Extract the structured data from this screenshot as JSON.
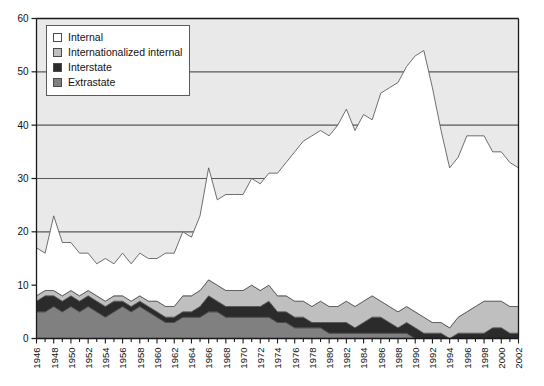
{
  "chart_data": {
    "type": "area",
    "stacked": true,
    "title": "",
    "subtitle": "",
    "xlabel": "",
    "ylabel": "",
    "xlim": [
      1946,
      2002
    ],
    "ylim": [
      0,
      60
    ],
    "yticks": [
      0,
      10,
      20,
      30,
      40,
      50,
      60
    ],
    "grid": "horizontal",
    "legend_position": "top-left",
    "x_tick_step_minor": 1,
    "x_tick_step_label": 2,
    "x": [
      1946,
      1947,
      1948,
      1949,
      1950,
      1951,
      1952,
      1953,
      1954,
      1955,
      1956,
      1957,
      1958,
      1959,
      1960,
      1961,
      1962,
      1963,
      1964,
      1965,
      1966,
      1967,
      1968,
      1969,
      1970,
      1971,
      1972,
      1973,
      1974,
      1975,
      1976,
      1977,
      1978,
      1979,
      1980,
      1981,
      1982,
      1983,
      1984,
      1985,
      1986,
      1987,
      1988,
      1989,
      1990,
      1991,
      1992,
      1993,
      1994,
      1995,
      1996,
      1997,
      1998,
      1999,
      2000,
      2001,
      2002
    ],
    "xtick_labels": [
      "1946",
      "1948",
      "1950",
      "1952",
      "1954",
      "1956",
      "1958",
      "1960",
      "1962",
      "1964",
      "1966",
      "1968",
      "1970",
      "1972",
      "1974",
      "1976",
      "1978",
      "1980",
      "1982",
      "1984",
      "1986",
      "1988",
      "1990",
      "1992",
      "1994",
      "1996",
      "1998",
      "2000",
      "2002"
    ],
    "series": [
      {
        "name": "Extrastate",
        "color": "#808080",
        "values": [
          5,
          5,
          6,
          5,
          6,
          5,
          6,
          5,
          4,
          5,
          6,
          5,
          6,
          5,
          4,
          3,
          3,
          4,
          4,
          4,
          5,
          5,
          4,
          4,
          4,
          4,
          4,
          4,
          3,
          3,
          2,
          2,
          2,
          2,
          1,
          1,
          1,
          1,
          1,
          1,
          1,
          1,
          1,
          1,
          0,
          0,
          0,
          0,
          0,
          0,
          0,
          0,
          0,
          0,
          0,
          0,
          0
        ]
      },
      {
        "name": "Interstate",
        "color": "#2b2b2b",
        "values": [
          2,
          3,
          2,
          2,
          2,
          2,
          2,
          2,
          2,
          2,
          1,
          1,
          1,
          1,
          1,
          1,
          1,
          1,
          1,
          2,
          3,
          2,
          2,
          2,
          2,
          2,
          2,
          3,
          2,
          2,
          2,
          2,
          1,
          1,
          2,
          2,
          2,
          1,
          2,
          3,
          3,
          2,
          1,
          2,
          2,
          1,
          1,
          1,
          0,
          1,
          1,
          1,
          1,
          2,
          2,
          1,
          1
        ]
      },
      {
        "name": "Internationalized internal",
        "color": "#bfbfbf",
        "values": [
          1,
          1,
          1,
          1,
          1,
          1,
          1,
          1,
          1,
          1,
          1,
          1,
          1,
          1,
          2,
          2,
          2,
          3,
          3,
          3,
          3,
          3,
          3,
          3,
          3,
          4,
          3,
          3,
          3,
          3,
          3,
          3,
          3,
          4,
          3,
          3,
          4,
          4,
          4,
          4,
          3,
          3,
          3,
          3,
          3,
          3,
          2,
          2,
          2,
          3,
          4,
          5,
          6,
          5,
          5,
          5,
          5
        ]
      },
      {
        "name": "Internal",
        "color": "#ffffff",
        "values": [
          9,
          7,
          14,
          10,
          9,
          8,
          7,
          6,
          8,
          6,
          8,
          7,
          8,
          8,
          8,
          10,
          10,
          12,
          11,
          14,
          21,
          16,
          18,
          18,
          18,
          20,
          20,
          21,
          23,
          25,
          28,
          30,
          32,
          32,
          32,
          34,
          36,
          33,
          35,
          33,
          39,
          41,
          43,
          45,
          48,
          50,
          44,
          36,
          30,
          30,
          33,
          32,
          31,
          28,
          28,
          27,
          26
        ]
      }
    ],
    "totals": [
      17,
      16,
      23,
      18,
      18,
      16,
      16,
      14,
      15,
      14,
      16,
      14,
      16,
      15,
      15,
      16,
      16,
      20,
      19,
      23,
      32,
      26,
      27,
      27,
      27,
      30,
      29,
      31,
      31,
      33,
      35,
      37,
      38,
      39,
      38,
      40,
      43,
      39,
      42,
      41,
      46,
      47,
      48,
      51,
      53,
      54,
      47,
      39,
      32,
      34,
      38,
      38,
      38,
      35,
      35,
      33,
      32
    ]
  },
  "legend": {
    "items": [
      {
        "label": "Internal",
        "color": "#ffffff"
      },
      {
        "label": "Internationalized internal",
        "color": "#bfbfbf"
      },
      {
        "label": "Interstate",
        "color": "#2b2b2b"
      },
      {
        "label": "Extrastate",
        "color": "#808080"
      }
    ]
  },
  "colors": {
    "plot_background": "#e9e9e9",
    "gridline": "#595959",
    "axis": "#1a1a1a",
    "page_background": "#ffffff"
  }
}
